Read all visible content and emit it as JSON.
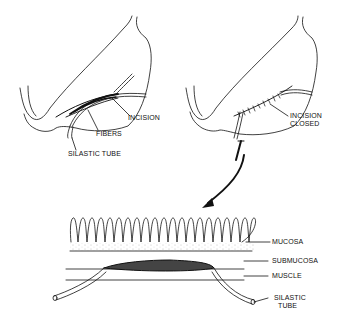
{
  "panels": {
    "left": {
      "labels": {
        "incision": "INCISION",
        "fibers": "FIBERS",
        "silastic_tube": "SILASTIC TUBE"
      }
    },
    "right": {
      "labels": {
        "incision_closed_1": "INCISION",
        "incision_closed_2": "CLOSED"
      }
    },
    "cross_section": {
      "labels": {
        "mucosa": "MUCOSA",
        "submucosa": "SUBMUCOSA",
        "muscle": "MUSCLE",
        "silastic_tube_1": "SILASTIC",
        "silastic_tube_2": "TUBE"
      }
    }
  },
  "colors": {
    "ink": "#111111",
    "background": "#ffffff"
  }
}
